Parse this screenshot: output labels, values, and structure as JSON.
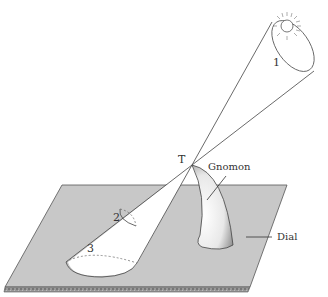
{
  "diagram": {
    "labels": {
      "point_t": "T",
      "region_1": "1",
      "region_2": "2",
      "region_3": "3",
      "gnomon": "Gnomon",
      "dial": "Dial"
    },
    "colors": {
      "dial_fill": "#c8c8c8",
      "line": "#444444",
      "background": "#ffffff"
    }
  }
}
